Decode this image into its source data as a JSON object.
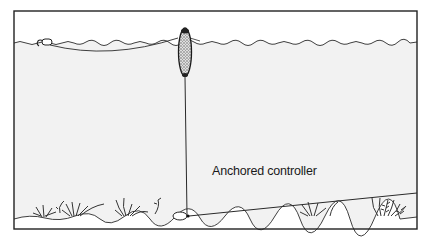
{
  "diagram": {
    "type": "fishing-rig-illustration",
    "labels": {
      "anchored_controller": "Anchored controller"
    },
    "colors": {
      "background": "#ffffff",
      "water": "#f2f2f2",
      "line": "#2a2a2a",
      "float_fill": "#bdbdbd"
    },
    "elements": [
      {
        "name": "water-surface",
        "description": "wavy line across top of frame"
      },
      {
        "name": "hook-bait",
        "description": "hook with bait floating at surface, left"
      },
      {
        "name": "surface-line",
        "description": "curved line from hook to float"
      },
      {
        "name": "float-controller",
        "description": "stippled oval float at surface"
      },
      {
        "name": "vertical-line",
        "description": "line from float down to anchor"
      },
      {
        "name": "anchor-weight",
        "description": "weight resting on seabed"
      },
      {
        "name": "anchor-line",
        "description": "diagonal line from anchor to right"
      },
      {
        "name": "seabed",
        "description": "wavy bottom with weeds"
      }
    ]
  }
}
